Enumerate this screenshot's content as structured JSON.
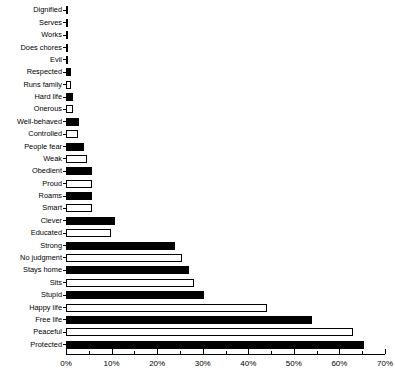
{
  "chart_data": {
    "type": "bar",
    "orientation": "horizontal",
    "title": "",
    "subtitle": "",
    "xlabel": "",
    "ylabel": "",
    "xlim": [
      0,
      70
    ],
    "grid": false,
    "legend": null,
    "x_tick_labels": [
      "0%",
      "10%",
      "20%",
      "30%",
      "40%",
      "50%",
      "60%",
      "70%"
    ],
    "x_ticks": [
      0,
      10,
      20,
      30,
      40,
      50,
      60,
      70
    ],
    "x_minor_ticks": [
      5,
      15,
      25,
      35,
      45,
      55,
      65
    ],
    "x_unit": "%",
    "categories": [
      "Dignified",
      "Serves",
      "Works",
      "Does chores",
      "Evil",
      "Respected",
      "Runs family",
      "Hard life",
      "Onerous",
      "Well-behaved",
      "Controlled",
      "People fear",
      "Weak",
      "Obedient",
      "Proud",
      "Roams",
      "Smart",
      "Clever",
      "Educated",
      "Strong",
      "No judgment",
      "Stays home",
      "Sits",
      "Stupid",
      "Happy life",
      "Free life",
      "Peaceful",
      "Protected"
    ],
    "values": [
      0.2,
      0.2,
      0.2,
      0.2,
      0.3,
      1.2,
      1.2,
      1.5,
      1.5,
      2.8,
      2.6,
      4.0,
      4.6,
      5.6,
      5.6,
      5.8,
      5.8,
      10.8,
      9.8,
      24.0,
      25.5,
      27.0,
      28.0,
      30.2,
      44.2,
      54.0,
      63.0,
      65.5
    ],
    "bar_fills": [
      "black",
      "white",
      "black",
      "white",
      "black",
      "black",
      "white",
      "black",
      "white",
      "black",
      "white",
      "black",
      "white",
      "black",
      "white",
      "black",
      "white",
      "black",
      "white",
      "black",
      "white",
      "black",
      "white",
      "black",
      "white",
      "black",
      "white",
      "black"
    ],
    "colors": {
      "bar_black": "#000000",
      "bar_white": "#ffffff",
      "bar_edge": "#000000",
      "axis": "#000000",
      "text": "#000000",
      "background": "#ffffff"
    }
  }
}
